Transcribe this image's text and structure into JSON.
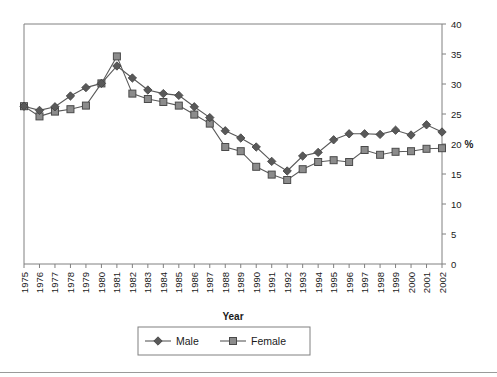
{
  "chart_data": {
    "type": "line",
    "title": "",
    "subtitle": "",
    "xlabel": "Year",
    "ylabel": "%",
    "ylabel_position": "right",
    "grid": false,
    "legend_position": "bottom",
    "xlim": [
      1975,
      2002
    ],
    "ylim": [
      0,
      40
    ],
    "ytick_step": 5,
    "yticks": [
      0,
      5,
      10,
      15,
      20,
      25,
      30,
      35,
      40
    ],
    "categories": [
      "1975",
      "1976",
      "1977",
      "1978",
      "1979",
      "1980",
      "1981",
      "1982",
      "1983",
      "1984",
      "1985",
      "1986",
      "1987",
      "1988",
      "1989",
      "1990",
      "1991",
      "1992",
      "1993",
      "1994",
      "1995",
      "1996",
      "1997",
      "1998",
      "1999",
      "2000",
      "2001",
      "2002"
    ],
    "series": [
      {
        "name": "Male",
        "marker": "diamond",
        "marker_color": "#595959",
        "line_color": "#595959",
        "values": [
          26.3,
          25.6,
          26.2,
          28.0,
          29.4,
          30.1,
          33.0,
          31.0,
          29.0,
          28.4,
          28.1,
          26.2,
          24.4,
          22.2,
          21.0,
          19.5,
          17.1,
          15.5,
          18.0,
          18.6,
          20.7,
          21.7,
          21.7,
          21.6,
          22.3,
          21.5,
          23.2,
          22.0
        ]
      },
      {
        "name": "Female",
        "marker": "square",
        "marker_color": "#8c8c8c",
        "line_color": "#595959",
        "values": [
          26.3,
          24.6,
          25.4,
          25.8,
          26.4,
          30.1,
          34.6,
          28.4,
          27.5,
          27.0,
          26.4,
          24.9,
          23.4,
          19.5,
          18.8,
          16.2,
          14.9,
          14.0,
          15.8,
          17.0,
          17.3,
          17.0,
          19.0,
          18.2,
          18.7,
          18.8,
          19.2,
          19.3
        ]
      }
    ],
    "colors": {
      "axis": "#808080",
      "plot_border": "#808080",
      "text": "#1a1a1a",
      "male_marker": "#595959",
      "female_marker": "#8c8c8c",
      "legend_border": "#808080",
      "bottom_rule": "#9a9a9a"
    }
  },
  "axis": {
    "x_title": "Year",
    "y_title": "%"
  },
  "legend": {
    "items": [
      {
        "label": "Male"
      },
      {
        "label": "Female"
      }
    ]
  }
}
